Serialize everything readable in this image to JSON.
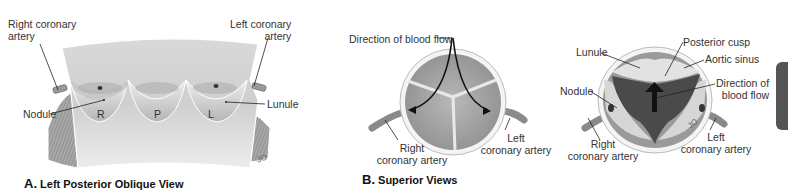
{
  "panel_a": {
    "caption_letter": "A.",
    "caption_text": "Left Posterior Oblique View",
    "labels": {
      "right_coronary_artery_1": "Right coronary",
      "right_coronary_artery_2": "artery",
      "left_coronary_artery_1": "Left coronary",
      "left_coronary_artery_2": "artery",
      "nodule": "Nodule",
      "lunule": "Lunule",
      "cusp_r": "R",
      "cusp_p": "P",
      "cusp_l": "L",
      "signature": "JO"
    }
  },
  "panel_b": {
    "caption_letter": "B.",
    "caption_text": "Superior Views",
    "left_view": {
      "direction_of_blood_flow": "Direction of blood flow",
      "right_coronary_artery_1": "Right",
      "right_coronary_artery_2": "coronary artery",
      "left_coronary_artery_1": "Left",
      "left_coronary_artery_2": "coronary artery"
    },
    "right_view": {
      "lunule": "Lunule",
      "posterior_cusp": "Posterior cusp",
      "aortic_sinus": "Aortic sinus",
      "direction_1": "Direction of",
      "direction_2": "blood flow",
      "nodule": "Nodule",
      "right_coronary_artery_1": "Right",
      "right_coronary_artery_2": "coronary artery",
      "left_coronary_artery_1": "Left",
      "left_coronary_artery_2": "coronary artery",
      "signature": "JO"
    }
  },
  "colors": {
    "tissue_light": "#e4e4e4",
    "tissue_mid": "#bdbdbd",
    "tissue_dark": "#7a7a7a",
    "muscle": "#9a9a9a",
    "leader_line": "#222222",
    "side_tab": "#555555"
  }
}
